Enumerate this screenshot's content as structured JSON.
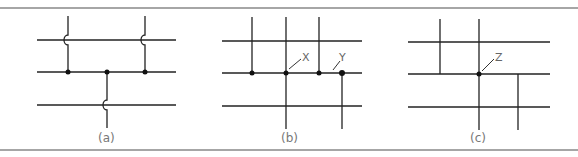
{
  "figure": {
    "panels": [
      {
        "id": "a",
        "caption": "(a)",
        "description": "Wires crossing without connection shown with hop-over arcs; junctions marked with dots"
      },
      {
        "id": "b",
        "caption": "(b)",
        "description": "Connections marked with dots; X indicates a 4-way dot junction, Y indicates a T-junction",
        "labels": [
          "X",
          "Y"
        ]
      },
      {
        "id": "c",
        "caption": "(c)",
        "description": "Crossings without dots are not connected; Z indicates a connected junction",
        "labels": [
          "Z"
        ]
      }
    ]
  }
}
